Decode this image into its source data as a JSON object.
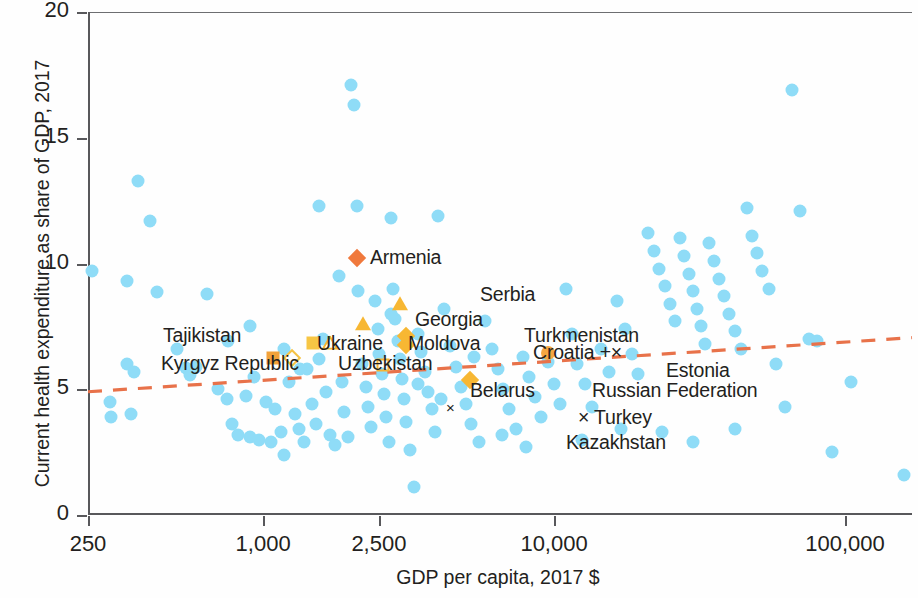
{
  "chart_data": {
    "type": "scatter",
    "title": "",
    "xlabel": "GDP per capita, 2017 $",
    "ylabel": "Current health expenditure as share of GDP, 2017",
    "xscale": "log",
    "xlim": [
      250,
      170000
    ],
    "ylim": [
      0,
      20
    ],
    "grid": false,
    "legend": "none",
    "xticks": [
      {
        "value": 250,
        "label": "250"
      },
      {
        "value": 1000,
        "label": "1,000"
      },
      {
        "value": 2500,
        "label": "2,500"
      },
      {
        "value": 10000,
        "label": "10,000"
      },
      {
        "value": 100000,
        "label": "100,000"
      }
    ],
    "yticks": [
      {
        "value": 0,
        "label": "0"
      },
      {
        "value": 5,
        "label": "5"
      },
      {
        "value": 10,
        "label": "10"
      },
      {
        "value": 15,
        "label": "15"
      },
      {
        "value": 20,
        "label": "20"
      }
    ],
    "colors": {
      "background_points": "#8fdcf7",
      "highlight_orange": "#f0793c",
      "highlight_yellow": "#f7b733",
      "highlight_gold": "#f5c243",
      "trendline": "#e8724a",
      "axis": "#58585b",
      "text": "#231f20"
    },
    "trendline": {
      "style": "dashed",
      "color": "#e8724a",
      "x_start": 250,
      "y_start": 4.9,
      "x_end": 170000,
      "y_end": 7.05
    },
    "highlighted_countries": [
      {
        "name": "Armenia",
        "x": 2100,
        "y": 10.2,
        "marker": "diamond-filled",
        "color": "#f0793c",
        "label_side": "left"
      },
      {
        "name": "Serbia",
        "x": 2950,
        "y": 8.4,
        "marker": "triangle-filled",
        "color": "#f7b733",
        "label_side": "above"
      },
      {
        "name": "Georgia",
        "x": 2200,
        "y": 7.6,
        "marker": "triangle-filled",
        "color": "#f7b733",
        "label_side": "above-left"
      },
      {
        "name": "Moldova",
        "x": 1700,
        "y": 6.85,
        "marker": "triangle-open",
        "color": "#f7b733",
        "label_side": "right"
      },
      {
        "name": "Ukraine",
        "x": 1480,
        "y": 6.85,
        "marker": "square-filled",
        "color": "#f7c644",
        "label_side": "left"
      },
      {
        "name": "Uzbekistan",
        "x": 1260,
        "y": 6.25,
        "marker": "diamond-open",
        "color": "#f5c243",
        "label_side": "right"
      },
      {
        "name": "Kyrgyz Republic",
        "x": 1080,
        "y": 6.25,
        "marker": "square-filled",
        "color": "#f2a23a",
        "label_side": "left"
      },
      {
        "name": "Tajikistan",
        "x": 830,
        "y": 7.2,
        "marker": "none",
        "color": "#f2a23a",
        "label_side": "label-only"
      },
      {
        "name": "Belarus",
        "x": 2580,
        "y": 5.95,
        "marker": "square-open",
        "color": "#f5b335",
        "label_side": "below"
      },
      {
        "name": "Turkmenistan",
        "x": 3100,
        "y": 7.1,
        "marker": "diamond-filled",
        "color": "#f7b733",
        "label_side": "right"
      },
      {
        "name": "Croatia",
        "x": 3100,
        "y": 6.75,
        "marker": "diamond-filled",
        "color": "#f7b733",
        "label_side": "right"
      },
      {
        "name": "Russian Federation",
        "x": 5150,
        "y": 5.35,
        "marker": "diamond-filled",
        "color": "#f7b733",
        "label_side": "right"
      },
      {
        "name": "Estonia",
        "x": 9500,
        "y": 6.45,
        "marker": "circle-filled",
        "color": "#f5a742",
        "label_side": "right"
      },
      {
        "name": "Turkey",
        "x": 4400,
        "y": 4.25,
        "marker": "cross",
        "color": "#231f20",
        "label_side": "right"
      },
      {
        "name": "Kazakhstan",
        "x": 4400,
        "y": 3.5,
        "marker": "none",
        "color": "#231f20",
        "label_side": "label-only"
      }
    ],
    "annotations": [
      {
        "text": "Armenia",
        "x_px": 370,
        "y_px": 246,
        "align": "left"
      },
      {
        "text": "Serbia",
        "x_px": 480,
        "y_px": 283,
        "align": "left"
      },
      {
        "text": "Georgia",
        "x_px": 415,
        "y_px": 308,
        "align": "left"
      },
      {
        "text": "Ukraine",
        "x_px": 317,
        "y_px": 332,
        "align": "left"
      },
      {
        "text": "Moldova",
        "x_px": 408,
        "y_px": 332,
        "align": "left"
      },
      {
        "text": "Turkmenistan",
        "x_px": 524,
        "y_px": 324,
        "align": "left"
      },
      {
        "text": "Croatia +×",
        "x_px": 533,
        "y_px": 341,
        "align": "left"
      },
      {
        "text": "Tajikistan",
        "x_px": 163,
        "y_px": 324,
        "align": "left"
      },
      {
        "text": "Kyrgyz Republic",
        "x_px": 161,
        "y_px": 352,
        "align": "left"
      },
      {
        "text": "Uzbekistan",
        "x_px": 338,
        "y_px": 352,
        "align": "left"
      },
      {
        "text": "Belarus",
        "x_px": 470,
        "y_px": 379,
        "align": "left"
      },
      {
        "text": "Estonia",
        "x_px": 666,
        "y_px": 359,
        "align": "left"
      },
      {
        "text": "Russian Federation",
        "x_px": 592,
        "y_px": 379,
        "align": "left"
      },
      {
        "text": "× Turkey",
        "x_px": 578,
        "y_px": 406,
        "align": "left"
      },
      {
        "text": "Kazakhstan",
        "x_px": 566,
        "y_px": 431,
        "align": "left"
      }
    ],
    "background_points": [
      [
        258,
        9.7
      ],
      [
        340,
        9.3
      ],
      [
        372,
        13.3
      ],
      [
        409,
        11.7
      ],
      [
        341,
        6.0
      ],
      [
        360,
        5.7
      ],
      [
        298,
        4.5
      ],
      [
        352,
        4.0
      ],
      [
        300,
        3.9
      ],
      [
        432,
        8.85
      ],
      [
        505,
        6.6
      ],
      [
        545,
        5.85
      ],
      [
        560,
        5.55
      ],
      [
        590,
        5.9
      ],
      [
        640,
        8.8
      ],
      [
        700,
        5.0
      ],
      [
        750,
        4.6
      ],
      [
        780,
        3.6
      ],
      [
        820,
        3.2
      ],
      [
        870,
        4.75
      ],
      [
        900,
        3.1
      ],
      [
        930,
        5.5
      ],
      [
        970,
        3.0
      ],
      [
        1020,
        4.5
      ],
      [
        1060,
        2.9
      ],
      [
        1100,
        4.2
      ],
      [
        1150,
        3.3
      ],
      [
        1180,
        2.4
      ],
      [
        1230,
        5.3
      ],
      [
        1290,
        4.0
      ],
      [
        1330,
        3.4
      ],
      [
        1380,
        2.9
      ],
      [
        1420,
        5.8
      ],
      [
        1470,
        4.4
      ],
      [
        1520,
        3.6
      ],
      [
        1560,
        12.3
      ],
      [
        1600,
        7.0
      ],
      [
        1640,
        4.9
      ],
      [
        1700,
        3.2
      ],
      [
        1760,
        2.8
      ],
      [
        1820,
        9.5
      ],
      [
        1870,
        5.3
      ],
      [
        1900,
        4.1
      ],
      [
        1950,
        3.1
      ],
      [
        2000,
        17.1
      ],
      [
        2050,
        16.3
      ],
      [
        2100,
        12.3
      ],
      [
        2180,
        6.0
      ],
      [
        2250,
        5.1
      ],
      [
        2300,
        4.3
      ],
      [
        2350,
        3.5
      ],
      [
        2420,
        8.5
      ],
      [
        2480,
        7.4
      ],
      [
        2500,
        6.4
      ],
      [
        2560,
        5.6
      ],
      [
        2600,
        4.8
      ],
      [
        2650,
        3.9
      ],
      [
        2700,
        2.9
      ],
      [
        2750,
        11.8
      ],
      [
        2800,
        9.0
      ],
      [
        2850,
        7.8
      ],
      [
        2900,
        6.9
      ],
      [
        2950,
        6.2
      ],
      [
        3000,
        5.4
      ],
      [
        3050,
        4.6
      ],
      [
        3100,
        3.7
      ],
      [
        3200,
        2.6
      ],
      [
        3300,
        1.1
      ],
      [
        3400,
        7.2
      ],
      [
        3500,
        6.5
      ],
      [
        3600,
        5.7
      ],
      [
        3700,
        4.9
      ],
      [
        3800,
        4.2
      ],
      [
        3900,
        3.3
      ],
      [
        4000,
        11.9
      ],
      [
        4200,
        8.2
      ],
      [
        4400,
        6.7
      ],
      [
        4600,
        5.9
      ],
      [
        4800,
        5.1
      ],
      [
        5000,
        4.4
      ],
      [
        5200,
        3.6
      ],
      [
        5500,
        2.9
      ],
      [
        5800,
        7.7
      ],
      [
        6100,
        6.6
      ],
      [
        6400,
        5.8
      ],
      [
        6700,
        5.0
      ],
      [
        7000,
        4.2
      ],
      [
        7400,
        3.4
      ],
      [
        7800,
        6.3
      ],
      [
        8200,
        5.5
      ],
      [
        8600,
        4.7
      ],
      [
        9000,
        3.9
      ],
      [
        9500,
        6.1
      ],
      [
        10000,
        5.2
      ],
      [
        10500,
        4.4
      ],
      [
        11000,
        9.0
      ],
      [
        11500,
        7.2
      ],
      [
        12000,
        6.0
      ],
      [
        12800,
        5.2
      ],
      [
        13500,
        4.3
      ],
      [
        14500,
        6.6
      ],
      [
        15500,
        5.7
      ],
      [
        16500,
        8.5
      ],
      [
        17500,
        7.4
      ],
      [
        18500,
        6.4
      ],
      [
        19500,
        5.6
      ],
      [
        21000,
        11.2
      ],
      [
        22000,
        10.5
      ],
      [
        23000,
        9.8
      ],
      [
        24000,
        9.1
      ],
      [
        25000,
        8.4
      ],
      [
        26000,
        7.7
      ],
      [
        27000,
        11.0
      ],
      [
        28000,
        10.3
      ],
      [
        29000,
        9.6
      ],
      [
        30000,
        8.9
      ],
      [
        31000,
        8.2
      ],
      [
        32000,
        7.5
      ],
      [
        33000,
        6.8
      ],
      [
        34000,
        10.8
      ],
      [
        35500,
        10.1
      ],
      [
        37000,
        9.4
      ],
      [
        38500,
        8.7
      ],
      [
        40000,
        8.0
      ],
      [
        42000,
        7.3
      ],
      [
        44000,
        6.6
      ],
      [
        46000,
        12.2
      ],
      [
        48000,
        11.1
      ],
      [
        50000,
        10.4
      ],
      [
        52000,
        9.7
      ],
      [
        55000,
        9.0
      ],
      [
        58000,
        6.0
      ],
      [
        62000,
        4.3
      ],
      [
        66000,
        16.9
      ],
      [
        70000,
        12.1
      ],
      [
        75000,
        7.0
      ],
      [
        80000,
        6.9
      ],
      [
        90000,
        2.5
      ],
      [
        105000,
        5.3
      ],
      [
        160000,
        1.6
      ],
      [
        760,
        6.9
      ],
      [
        900,
        7.5
      ],
      [
        1180,
        6.6
      ],
      [
        1340,
        5.8
      ],
      [
        1550,
        6.2
      ],
      [
        2120,
        8.9
      ],
      [
        2760,
        8.0
      ],
      [
        3400,
        5.2
      ],
      [
        4100,
        4.6
      ],
      [
        5300,
        6.3
      ],
      [
        6600,
        3.2
      ],
      [
        8000,
        2.7
      ],
      [
        12500,
        3.0
      ],
      [
        17000,
        3.4
      ],
      [
        23500,
        3.3
      ],
      [
        30000,
        2.9
      ],
      [
        42000,
        3.4
      ]
    ]
  }
}
